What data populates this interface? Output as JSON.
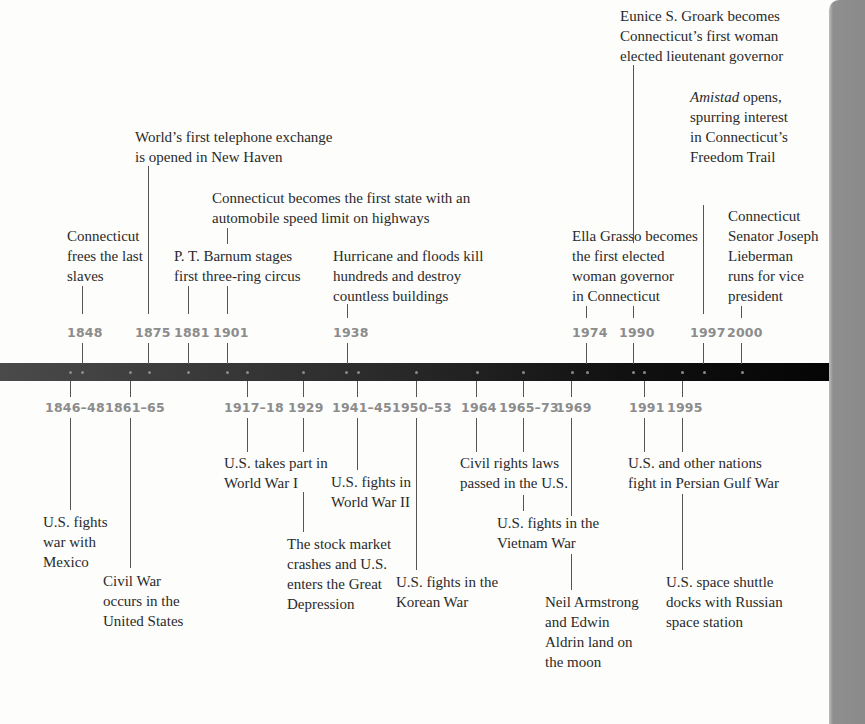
{
  "timeline": {
    "colors": {
      "bar": "#111111",
      "year_label": "#8c8c8c",
      "text": "#2a2a2a",
      "page_edge": "#8a8a8a"
    },
    "upper_events": [
      {
        "year": "1848",
        "text": "Connecticut\nfrees the last\nslaves"
      },
      {
        "year": "1875",
        "text": "World’s first telephone exchange\nis opened in New Haven"
      },
      {
        "year": "1881",
        "text": "P. T. Barnum stages\nfirst three-ring circus"
      },
      {
        "year": "1901",
        "text": "Connecticut becomes the first state with an\nautomobile speed limit on highways"
      },
      {
        "year": "1938",
        "text": "Hurricane and floods kill\nhundreds and destroy\ncountless buildings"
      },
      {
        "year": "1974",
        "text": "Ella Grasso becomes\nthe first elected\nwoman governor\nin Connecticut"
      },
      {
        "year": "1990",
        "text": "Eunice S. Groark becomes\nConnecticut’s first woman\nelected lieutenant governor"
      },
      {
        "year": "1997",
        "text_italic": "Amistad",
        "text": " opens,\nspurring interest\nin Connecticut’s\nFreedom Trail"
      },
      {
        "year": "2000",
        "text": "Connecticut\nSenator Joseph\nLieberman\nruns for vice\npresident"
      }
    ],
    "lower_events": [
      {
        "year": "1846–48",
        "text": "U.S. fights\nwar with\nMexico"
      },
      {
        "year": "1861–65",
        "text": "Civil War\noccurs in the\nUnited States"
      },
      {
        "year": "1917–18",
        "text": "U.S. takes part in\nWorld War I"
      },
      {
        "year": "1929",
        "text": "The stock market\ncrashes and U.S.\nenters the Great\nDepression"
      },
      {
        "year": "1941–45",
        "text": "U.S. fights in\nWorld War II"
      },
      {
        "year": "1950–53",
        "text": "U.S. fights in the\nKorean War"
      },
      {
        "year": "1964",
        "text": "Civil rights laws\npassed in the U.S."
      },
      {
        "year": "1965–73",
        "text": "U.S. fights in the\nVietnam War"
      },
      {
        "year": "1969",
        "text": "Neil Armstrong\nand Edwin\nAldrin land on\nthe moon"
      },
      {
        "year": "1991",
        "text": "U.S. and other nations\nfight in Persian Gulf War"
      },
      {
        "year": "1995",
        "text": "U.S. space shuttle\ndocks with Russian\nspace station"
      }
    ]
  }
}
